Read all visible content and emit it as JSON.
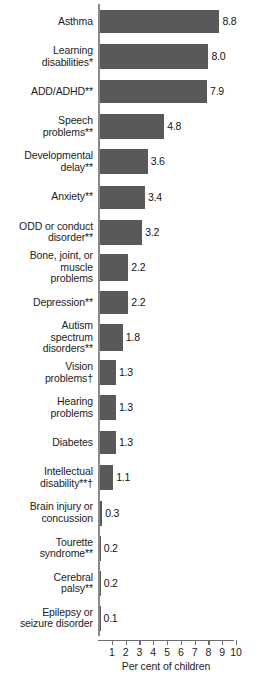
{
  "chart_data": {
    "type": "bar",
    "orientation": "horizontal",
    "title": "",
    "xlabel": "Per cent of children",
    "ylabel": "",
    "xlim": [
      0,
      10.4
    ],
    "grid": false,
    "legend": null,
    "xticks": [
      1,
      2,
      3,
      4,
      5,
      6,
      7,
      8,
      9,
      10
    ],
    "xtick_labels": [
      "1",
      "2",
      "3",
      "4",
      "5",
      "6",
      "7",
      "8",
      "9",
      "10"
    ],
    "bar_color": "#595959",
    "categories": [
      "Asthma",
      "Learning\ndisabilities*",
      "ADD/ADHD**",
      "Speech\nproblems**",
      "Developmental\ndelay**",
      "Anxiety**",
      "ODD or conduct\ndisorder**",
      "Bone, joint, or\nmuscle\nproblems",
      "Depression**",
      "Autism\nspectrum\ndisorders**",
      "Vision\nproblems†",
      "Hearing\nproblems",
      "Diabetes",
      "Intellectual\ndisability**†",
      "Brain injury or\nconcussion",
      "Tourette\nsyndrome**",
      "Cerebral\npalsy**",
      "Epilepsy or\nseizure disorder"
    ],
    "values": [
      8.8,
      8.0,
      7.9,
      4.8,
      3.6,
      3.4,
      3.2,
      2.2,
      2.2,
      1.8,
      1.3,
      1.3,
      1.3,
      1.1,
      0.3,
      0.2,
      0.2,
      0.1
    ],
    "value_labels": [
      "8.8",
      "8.0",
      "7.9",
      "4.8",
      "3.6",
      "3.4",
      "3.2",
      "2.2",
      "2.2",
      "1.8",
      "1.3",
      "1.3",
      "1.3",
      "1.1",
      "0.3",
      "0.2",
      "0.2",
      "0.1"
    ]
  }
}
